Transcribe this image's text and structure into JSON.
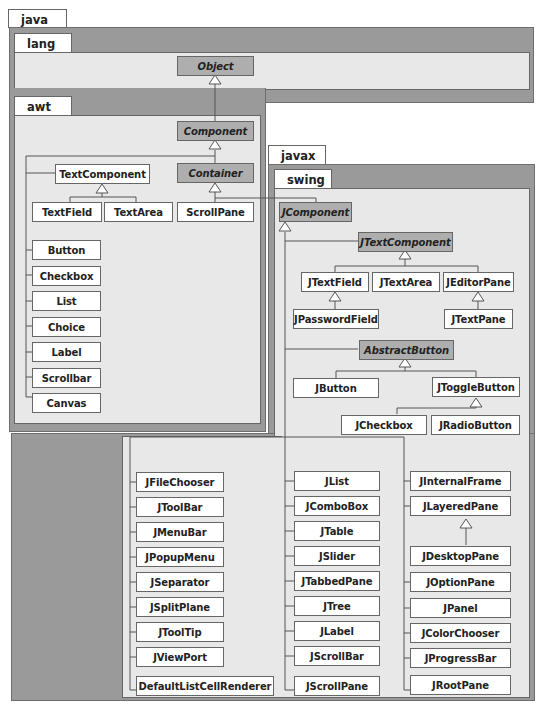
{
  "packages": {
    "java": "java",
    "lang": "lang",
    "awt": "awt",
    "javax": "javax",
    "swing": "swing"
  },
  "lang_classes": {
    "object": "Object"
  },
  "awt_classes": {
    "component": "Component",
    "container": "Container",
    "text_component": "TextComponent",
    "text_field": "TextField",
    "text_area": "TextArea",
    "scroll_pane": "ScrollPane",
    "list": [
      "Button",
      "Checkbox",
      "List",
      "Choice",
      "Label",
      "Scrollbar",
      "Canvas"
    ]
  },
  "swing_classes": {
    "jcomponent": "JComponent",
    "jtext_component": "JTextComponent",
    "jtext_field": "JTextField",
    "jtext_area": "JTextArea",
    "jeditor_pane": "JEditorPane",
    "jpassword_field": "JPasswordField",
    "jtext_pane": "JTextPane",
    "abstract_button": "AbstractButton",
    "jbutton": "JButton",
    "jtoggle_button": "JToggleButton",
    "jcheckbox": "JCheckbox",
    "jradio_button": "JRadioButton",
    "column1": [
      "JFileChooser",
      "JToolBar",
      "JMenuBar",
      "JPopupMenu",
      "JSeparator",
      "JSplitPlane",
      "JToolTip",
      "JViewPort",
      "DefaultListCellRenderer"
    ],
    "column2": [
      "JList",
      "JComboBox",
      "JTable",
      "JSlider",
      "JTabbedPane",
      "JTree",
      "JLabel",
      "JScrollBar",
      "JScrollPane"
    ],
    "column3_top": [
      "JInternalFrame",
      "JLayeredPane"
    ],
    "jdesktop_pane": "JDesktopPane",
    "column3": [
      "JOptionPane",
      "JPanel",
      "JColorChooser",
      "JProgressBar",
      "JRootPane"
    ]
  }
}
